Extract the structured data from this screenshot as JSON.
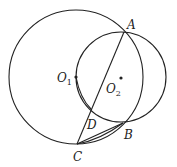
{
  "diagram": {
    "circles": [
      {
        "name": "O1",
        "cx": 76,
        "cy": 77,
        "r": 67
      },
      {
        "name": "O2",
        "cx": 121,
        "cy": 77,
        "r": 45
      }
    ],
    "points": {
      "A": {
        "x": 124,
        "y": 32
      },
      "B": {
        "x": 123,
        "y": 123
      },
      "C": {
        "x": 77,
        "y": 144
      },
      "D": {
        "x": 91,
        "y": 109
      },
      "O1": {
        "x": 76,
        "y": 77
      },
      "O2": {
        "x": 121,
        "y": 78
      }
    },
    "segments": [
      [
        "C",
        "A"
      ],
      [
        "C",
        "B"
      ],
      [
        "C",
        "D"
      ]
    ],
    "labels": {
      "A": "A",
      "B": "B",
      "C": "C",
      "D": "D",
      "O1_main": "O",
      "O1_sub": "1",
      "O2_main": "O",
      "O2_sub": "2"
    },
    "stroke_color": "#222222"
  }
}
